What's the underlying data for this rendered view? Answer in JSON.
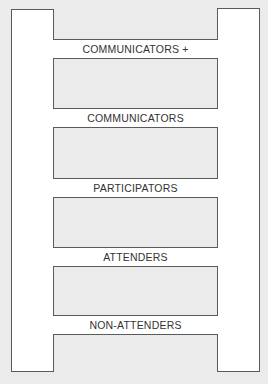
{
  "diagram": {
    "type": "ladder",
    "colors": {
      "background": "#ebebeb",
      "box_fill": "#ffffff",
      "border": "#5a5a5a",
      "text": "#333333"
    },
    "rungs": [
      {
        "label": "COMMUNICATORS +",
        "top": 39
      },
      {
        "label": "COMMUNICATORS",
        "top": 108
      },
      {
        "label": "PARTICIPATORS",
        "top": 178
      },
      {
        "label": "ATTENDERS",
        "top": 247
      },
      {
        "label": "NON-ATTENDERS",
        "top": 315
      }
    ]
  }
}
